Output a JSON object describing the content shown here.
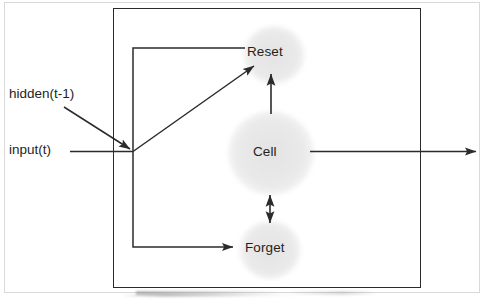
{
  "diagram": {
    "title": "",
    "type": "recurrent-cell-block-diagram",
    "unit_box": {
      "label": ""
    },
    "nodes": [
      {
        "id": "reset",
        "label": "Reset",
        "shape": "circle",
        "fill": "#e6e6e6"
      },
      {
        "id": "cell",
        "label": "Cell",
        "shape": "circle",
        "fill": "#e6e6e6"
      },
      {
        "id": "forget",
        "label": "Forget",
        "shape": "circle",
        "fill": "#e6e6e6"
      }
    ],
    "inputs": [
      {
        "id": "hidden",
        "label": "hidden(t-1)"
      },
      {
        "id": "input",
        "label": "input(t)"
      }
    ],
    "edges": [
      {
        "from": "hidden",
        "to": "junction",
        "arrow": "single"
      },
      {
        "from": "input",
        "to": "junction",
        "arrow": "none"
      },
      {
        "from": "junction",
        "to": "reset",
        "arrow": "single",
        "style": "diagonal"
      },
      {
        "from": "junction",
        "to": "reset",
        "arrow": "none",
        "style": "orthogonal-bracket"
      },
      {
        "from": "junction",
        "to": "forget",
        "arrow": "single",
        "style": "orthogonal-bracket"
      },
      {
        "from": "cell",
        "to": "reset",
        "arrow": "single",
        "style": "vertical"
      },
      {
        "from": "cell",
        "to": "forget",
        "arrow": "double",
        "style": "vertical"
      },
      {
        "from": "cell",
        "to": "output",
        "arrow": "single",
        "style": "horizontal"
      }
    ],
    "colors": {
      "line": "#2b2b2b",
      "node_fill": "#e6e6e6",
      "text": "#231f20",
      "page_border": "#d9d9d9"
    }
  }
}
